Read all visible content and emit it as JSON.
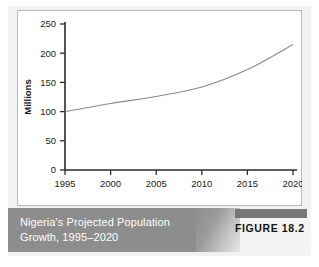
{
  "caption": {
    "line1": "Nigeria's Projected Population",
    "line2": "Growth, 1995–2020",
    "figure_label": "FIGURE 18.2"
  },
  "colors": {
    "mat": "#f2f2f2",
    "panel": "#ffffff",
    "panel_border": "#b9b9b9",
    "axis": "#2b2b2b",
    "curve": "#8a8a8a",
    "caption_band": "#8d8d8d",
    "caption_text": "#ffffff",
    "figure_tab": "#777777",
    "figure_text": "#151515"
  },
  "chart_data": {
    "type": "line",
    "title": "Nigeria's Projected Population Growth, 1995–2020",
    "xlabel": "",
    "ylabel": "Millions",
    "xlim": [
      1995,
      2020
    ],
    "ylim": [
      0,
      250
    ],
    "grid": false,
    "legend": false,
    "xticks": [
      1995,
      2000,
      2005,
      2010,
      2015,
      2020
    ],
    "xticklabels": [
      "1995",
      "2000",
      "2005",
      "2010",
      "2015",
      "2020"
    ],
    "yticks": [
      0,
      50,
      100,
      150,
      200,
      250
    ],
    "yticklabels": [
      "0",
      "50",
      "100",
      "150",
      "200",
      "250"
    ],
    "series": [
      {
        "name": "Projected population",
        "x": [
          1995,
          2000,
          2005,
          2010,
          2015,
          2020
        ],
        "values": [
          100,
          114,
          126,
          142,
          172,
          215
        ]
      }
    ]
  }
}
